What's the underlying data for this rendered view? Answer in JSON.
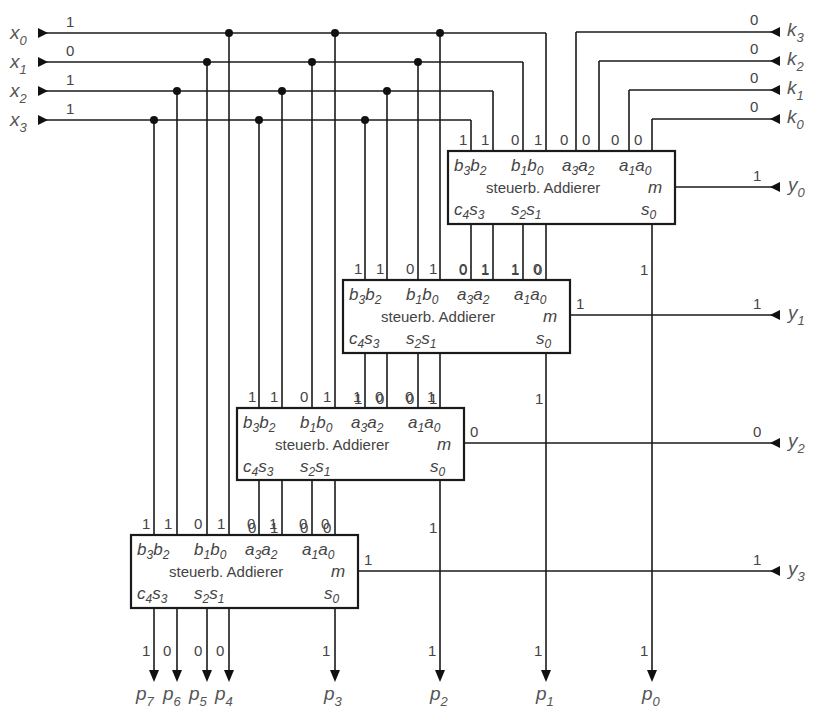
{
  "diagram": {
    "inputs_x": [
      {
        "name": "x",
        "sub": "0",
        "value": "1"
      },
      {
        "name": "x",
        "sub": "1",
        "value": "0"
      },
      {
        "name": "x",
        "sub": "2",
        "value": "1"
      },
      {
        "name": "x",
        "sub": "3",
        "value": "1"
      }
    ],
    "inputs_k": [
      {
        "name": "k",
        "sub": "3",
        "value": "0"
      },
      {
        "name": "k",
        "sub": "2",
        "value": "0"
      },
      {
        "name": "k",
        "sub": "1",
        "value": "0"
      },
      {
        "name": "k",
        "sub": "0",
        "value": "0"
      }
    ],
    "inputs_y": [
      {
        "name": "y",
        "sub": "0",
        "value": "1",
        "m_value": ""
      },
      {
        "name": "y",
        "sub": "1",
        "value": "1",
        "m_value": "1"
      },
      {
        "name": "y",
        "sub": "2",
        "value": "0",
        "m_value": "0"
      },
      {
        "name": "y",
        "sub": "3",
        "value": "1",
        "m_value": "1"
      }
    ],
    "adders": [
      {
        "title": "steuerb. Addierer",
        "input_values": [
          "1",
          "1",
          "0",
          "1",
          "0",
          "0",
          "0",
          "0"
        ],
        "output_values": [
          "0",
          "1",
          "1",
          "0"
        ],
        "s0_value": "1"
      },
      {
        "title": "steuerb. Addierer",
        "input_values": [
          "1",
          "1",
          "0",
          "1",
          "0",
          "1",
          "1",
          "0"
        ],
        "output_values": [
          "1",
          "0",
          "0",
          "1"
        ],
        "s0_value": "1"
      },
      {
        "title": "steuerb. Addierer",
        "input_values": [
          "1",
          "1",
          "0",
          "1",
          "1",
          "0",
          "0",
          "1"
        ],
        "output_values": [
          "0",
          "1",
          "0",
          "0"
        ],
        "s0_value": "1"
      },
      {
        "title": "steuerb. Addierer",
        "input_values": [
          "1",
          "1",
          "0",
          "1",
          "0",
          "1",
          "0",
          "0"
        ],
        "output_values": [
          "1",
          "0",
          "0",
          "0"
        ],
        "s0_value": "1"
      }
    ],
    "pins": {
      "b3": {
        "n": "b",
        "s": "3"
      },
      "b2": {
        "n": "b",
        "s": "2"
      },
      "b1": {
        "n": "b",
        "s": "1"
      },
      "b0": {
        "n": "b",
        "s": "0"
      },
      "a3": {
        "n": "a",
        "s": "3"
      },
      "a2": {
        "n": "a",
        "s": "2"
      },
      "a1": {
        "n": "a",
        "s": "1"
      },
      "a0": {
        "n": "a",
        "s": "0"
      },
      "c4": {
        "n": "c",
        "s": "4"
      },
      "s3": {
        "n": "s",
        "s": "3"
      },
      "s2": {
        "n": "s",
        "s": "2"
      },
      "s1": {
        "n": "s",
        "s": "1"
      },
      "s0": {
        "n": "s",
        "s": "0"
      },
      "m": {
        "n": "m"
      }
    },
    "outputs_p": [
      {
        "name": "p",
        "sub": "7",
        "value": "1"
      },
      {
        "name": "p",
        "sub": "6",
        "value": "0"
      },
      {
        "name": "p",
        "sub": "5",
        "value": "0"
      },
      {
        "name": "p",
        "sub": "4",
        "value": "0"
      },
      {
        "name": "p",
        "sub": "3",
        "value": "1"
      },
      {
        "name": "p",
        "sub": "2",
        "value": "1"
      },
      {
        "name": "p",
        "sub": "1",
        "value": "1"
      },
      {
        "name": "p",
        "sub": "0",
        "value": "1"
      }
    ]
  }
}
